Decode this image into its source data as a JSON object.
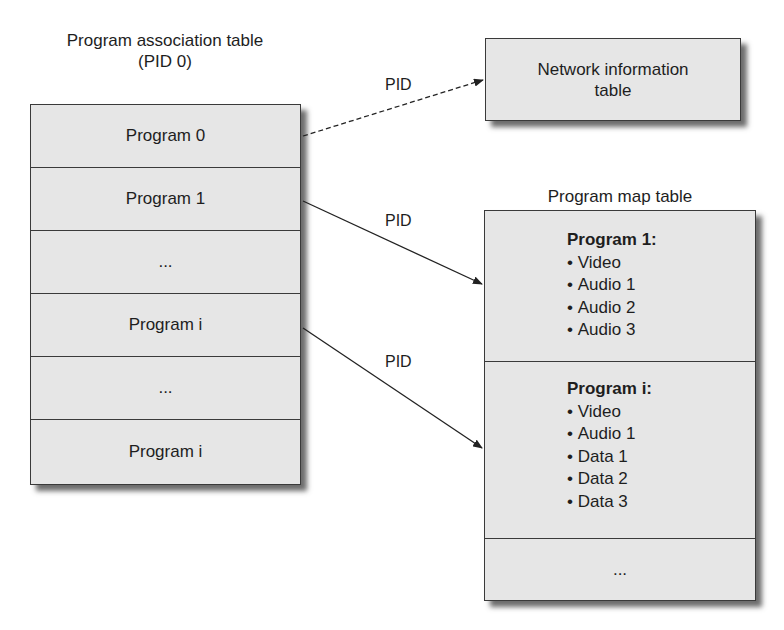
{
  "pat": {
    "title_line1": "Program association table",
    "title_line2": "(PID 0)",
    "rows": [
      {
        "label": "Program 0"
      },
      {
        "label": "Program 1"
      },
      {
        "label": "..."
      },
      {
        "label": "Program i"
      },
      {
        "label": "..."
      },
      {
        "label": "Program i"
      }
    ]
  },
  "nit": {
    "line1": "Network information",
    "line2": "table"
  },
  "pmt": {
    "title": "Program map table",
    "sections": [
      {
        "title": "Program 1:",
        "items": [
          "Video",
          "Audio 1",
          "Audio 2",
          "Audio 3"
        ]
      },
      {
        "title": "Program i:",
        "items": [
          "Video",
          "Audio 1",
          "Data 1",
          "Data 2",
          "Data 3"
        ]
      }
    ],
    "more": "..."
  },
  "arrows": {
    "nit_label": "PID",
    "pmt1_label": "PID",
    "pmti_label": "PID"
  },
  "colors": {
    "box_fill": "#e6e6e6",
    "border": "#3a3a3a",
    "text": "#1e1e1e"
  }
}
